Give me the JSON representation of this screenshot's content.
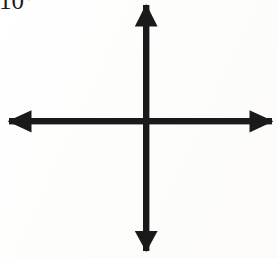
{
  "canvas": {
    "width": 277,
    "height": 258,
    "background_color": "#fefefe",
    "ink_color": "#1a1a1a"
  },
  "annotations": {
    "corner_label": {
      "text": "10°",
      "note_clipped": "clipped by top edge of image",
      "x": 0,
      "y": 0,
      "color": "#1b1b1b"
    }
  },
  "figure": {
    "name": "four-way-axes-arrow",
    "center": {
      "x": 146,
      "y": 121
    },
    "stroke_width": 6,
    "color": "#1a1a1a",
    "arrows": [
      {
        "name": "up-arrow",
        "direction": "up",
        "tip": {
          "x": 146,
          "y": 5
        },
        "tail": {
          "x": 146,
          "y": 121
        },
        "head_length": 21,
        "head_width": 22
      },
      {
        "name": "down-arrow",
        "direction": "down",
        "tip": {
          "x": 146,
          "y": 251
        },
        "tail": {
          "x": 146,
          "y": 121
        },
        "head_length": 20,
        "head_width": 22
      },
      {
        "name": "left-arrow",
        "direction": "left",
        "tip": {
          "x": 9,
          "y": 121
        },
        "tail": {
          "x": 146,
          "y": 121
        },
        "head_length": 23,
        "head_width": 22
      },
      {
        "name": "right-arrow",
        "direction": "right",
        "tip": {
          "x": 272,
          "y": 121
        },
        "tail": {
          "x": 146,
          "y": 121
        },
        "head_length": 23,
        "head_width": 22
      }
    ]
  }
}
